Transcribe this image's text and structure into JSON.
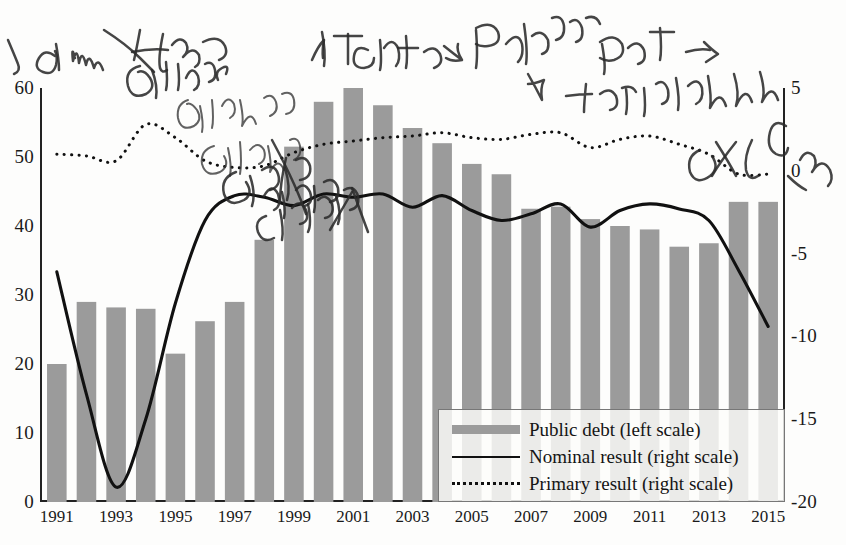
{
  "chart_data": {
    "type": "bar",
    "title": "",
    "subtitle": "",
    "xlabel": "",
    "ylabel_left": "",
    "ylabel_right": "",
    "grid": false,
    "legend_position": "bottom-right",
    "x": [
      1991,
      1992,
      1993,
      1994,
      1995,
      1996,
      1997,
      1998,
      1999,
      2000,
      2001,
      2002,
      2003,
      2004,
      2005,
      2006,
      2007,
      2008,
      2009,
      2010,
      2011,
      2012,
      2013,
      2014,
      2015
    ],
    "categories": [
      "1991",
      "1992",
      "1993",
      "1994",
      "1995",
      "1996",
      "1997",
      "1998",
      "1999",
      "2000",
      "2001",
      "2002",
      "2003",
      "2004",
      "2005",
      "2006",
      "2007",
      "2008",
      "2009",
      "2010",
      "2011",
      "2012",
      "2013",
      "2014",
      "2015"
    ],
    "x_tick_labels": [
      "1991",
      "1993",
      "1995",
      "1997",
      "1999",
      "2001",
      "2003",
      "2005",
      "2007",
      "2009",
      "2011",
      "2013",
      "2015"
    ],
    "left_axis": {
      "ticks": [
        0,
        10,
        20,
        30,
        40,
        50,
        60
      ],
      "tick_labels": [
        "0",
        "10",
        "20",
        "30",
        "40",
        "50",
        "60"
      ],
      "ylim": [
        0,
        60
      ]
    },
    "right_axis": {
      "ticks": [
        5,
        0,
        -5,
        -10,
        -15,
        -20
      ],
      "tick_labels": [
        "5",
        "0",
        "-5",
        "-10",
        "-15",
        "-20"
      ],
      "ylim": [
        -20,
        5
      ]
    },
    "series": [
      {
        "name": "Public debt (left scale)",
        "type": "bar",
        "axis": "left",
        "color": "#9b9b9b",
        "values": [
          20.0,
          29.0,
          28.2,
          28.0,
          21.5,
          26.2,
          29.0,
          38.0,
          51.5,
          58.0,
          60.0,
          57.5,
          54.2,
          52.0,
          49.0,
          47.5,
          42.5,
          42.8,
          41.0,
          40.0,
          39.5,
          37.0,
          37.5,
          43.5,
          43.5
        ]
      },
      {
        "name": "Nominal result (right scale)",
        "type": "line",
        "axis": "right",
        "style": "solid",
        "color": "#111111",
        "values": [
          -6.1,
          -13.5,
          -19.1,
          -15.0,
          -8.0,
          -3.0,
          -1.5,
          -1.6,
          -2.1,
          -1.4,
          -1.6,
          -1.4,
          -2.2,
          -1.5,
          -2.4,
          -3.0,
          -2.6,
          -2.0,
          -3.4,
          -2.4,
          -2.0,
          -2.3,
          -3.0,
          -6.0,
          -9.4
        ]
      },
      {
        "name": "Primary result (right scale)",
        "type": "line",
        "axis": "right",
        "style": "dotted",
        "color": "#111111",
        "values": [
          1.0,
          0.9,
          0.6,
          2.8,
          2.0,
          0.6,
          0.2,
          0.3,
          1.1,
          1.6,
          1.8,
          2.0,
          2.1,
          2.3,
          2.0,
          1.9,
          2.2,
          2.3,
          1.4,
          1.9,
          2.1,
          1.6,
          1.0,
          -0.2,
          -0.2
        ]
      }
    ]
  },
  "legend": {
    "items": [
      {
        "key": "bar",
        "label": "Public debt (left scale)"
      },
      {
        "key": "solid-line",
        "label": "Nominal result (right scale)"
      },
      {
        "key": "dotted-line",
        "label": "Primary result (right scale)"
      }
    ]
  },
  "annotations": {
    "handwriting": [
      {
        "text": "a mu Better walls collapse",
        "position": "top-left"
      },
      {
        "text": "↗ Interest →",
        "position": "top-center"
      },
      {
        "text": "Public Debt ⇒",
        "position": "top-right"
      },
      {
        "text": "↗ Explicit",
        "position": "right"
      },
      {
        "text": "curve path of numbers",
        "position": "center"
      }
    ]
  }
}
